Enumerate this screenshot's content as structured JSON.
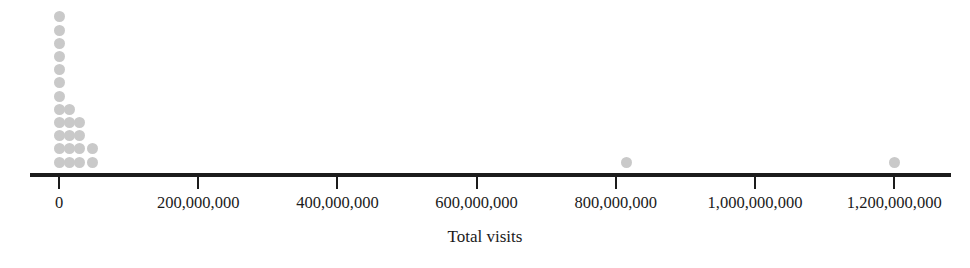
{
  "chart_data": {
    "type": "scatter",
    "subtype": "dot-plot",
    "title": "",
    "xlabel": "Total visits",
    "ylabel": "",
    "xlim": [
      -20000000,
      1320000000
    ],
    "grid": false,
    "legend": null,
    "dot_color": "#c9c9c9",
    "axis_color": "#1c1c1c",
    "tick_values": [
      0,
      200000000,
      400000000,
      600000000,
      800000000,
      1000000000,
      1200000000
    ],
    "tick_labels": [
      "0",
      "200,000,000",
      "400,000,000",
      "600,000,000",
      "800,000,000",
      "1,000,000,000",
      "1,200,000,000"
    ],
    "stack_bin_width": 15000000,
    "stacks": [
      {
        "x": 0,
        "count": 12
      },
      {
        "x": 15000000,
        "count": 5
      },
      {
        "x": 30000000,
        "count": 4
      },
      {
        "x": 48000000,
        "count": 2
      }
    ],
    "outliers": [
      {
        "x": 815000000,
        "count": 1
      },
      {
        "x": 1200000000,
        "count": 1
      }
    ],
    "values": [
      0,
      0,
      0,
      0,
      0,
      0,
      0,
      0,
      0,
      0,
      0,
      0,
      15000000,
      15000000,
      15000000,
      15000000,
      15000000,
      30000000,
      30000000,
      30000000,
      30000000,
      48000000,
      48000000,
      815000000,
      1200000000
    ],
    "total_points": 25
  }
}
